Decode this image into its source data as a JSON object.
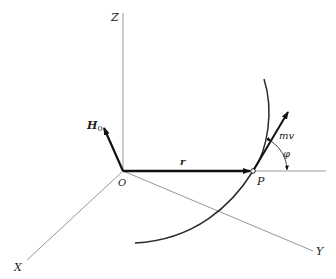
{
  "figure": {
    "type": "3D vector diagram — angular momentum of a particle",
    "axes": {
      "z_label": "Z",
      "x_label": "X",
      "y_label": "Y",
      "origin_label": "O"
    },
    "vectors": {
      "angular_momentum_label": "H",
      "angular_momentum_subscript": "0",
      "position_label": "r",
      "momentum_label": "mv"
    },
    "point_label": "P",
    "angle_label": "φ",
    "colors": {
      "axis": "#9a9a9a",
      "vector": "#111111",
      "curve": "#2a2a2a",
      "text": "#222222"
    }
  }
}
